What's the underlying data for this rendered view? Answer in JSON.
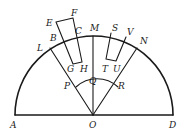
{
  "figure": {
    "stroke_color": "#1a1a1a",
    "background": "#ffffff"
  },
  "points": {
    "A": {
      "label": "A",
      "x": 15,
      "y": 115
    },
    "O": {
      "label": "O",
      "x": 93,
      "y": 115
    },
    "D": {
      "label": "D",
      "x": 173,
      "y": 115
    },
    "M": {
      "label": "M",
      "x": 93,
      "y": 36
    },
    "L": {
      "label": "L",
      "x": 50,
      "y": 48
    },
    "N": {
      "label": "N",
      "x": 137,
      "y": 48
    },
    "B": {
      "label": "B",
      "x": 62,
      "y": 40
    },
    "C": {
      "label": "C",
      "x": 78,
      "y": 37
    },
    "E": {
      "label": "E",
      "x": 56,
      "y": 22
    },
    "F": {
      "label": "F",
      "x": 73,
      "y": 18
    },
    "G": {
      "label": "G",
      "x": 73,
      "y": 64
    },
    "H": {
      "label": "H",
      "x": 82,
      "y": 62
    },
    "S": {
      "label": "S",
      "x": 111,
      "y": 33
    },
    "V": {
      "label": "V",
      "x": 126,
      "y": 37
    },
    "T": {
      "label": "T",
      "x": 106,
      "y": 59
    },
    "U": {
      "label": "U",
      "x": 116,
      "y": 61
    },
    "P": {
      "label": "P",
      "x": 76,
      "y": 87
    },
    "Q": {
      "label": "Q",
      "x": 93,
      "y": 84
    },
    "R": {
      "label": "R",
      "x": 118,
      "y": 87
    }
  },
  "labels": [
    {
      "text": "A",
      "x": 10,
      "y": 128
    },
    {
      "text": "O",
      "x": 89,
      "y": 128
    },
    {
      "text": "D",
      "x": 169,
      "y": 128
    },
    {
      "text": "L",
      "x": 37,
      "y": 51
    },
    {
      "text": "B",
      "x": 50,
      "y": 41
    },
    {
      "text": "E",
      "x": 46,
      "y": 26
    },
    {
      "text": "F",
      "x": 71,
      "y": 16
    },
    {
      "text": "C",
      "x": 75,
      "y": 34
    },
    {
      "text": "M",
      "x": 90,
      "y": 31
    },
    {
      "text": "S",
      "x": 112,
      "y": 31
    },
    {
      "text": "V",
      "x": 127,
      "y": 35
    },
    {
      "text": "N",
      "x": 140,
      "y": 44
    },
    {
      "text": "G",
      "x": 67,
      "y": 72
    },
    {
      "text": "H",
      "x": 80,
      "y": 72
    },
    {
      "text": "T",
      "x": 102,
      "y": 72
    },
    {
      "text": "U",
      "x": 113,
      "y": 72
    },
    {
      "text": "Q",
      "x": 89,
      "y": 84
    },
    {
      "text": "P",
      "x": 64,
      "y": 89
    },
    {
      "text": "R",
      "x": 118,
      "y": 89
    }
  ]
}
